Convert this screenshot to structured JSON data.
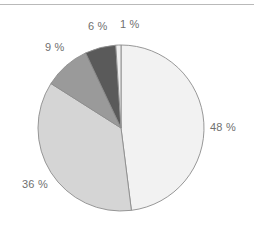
{
  "figure": {
    "background": "#ffffff",
    "rule_color": "#b9b9b9",
    "label_color": "#6f6f6f"
  },
  "chart_data": {
    "type": "pie",
    "title": "",
    "subtitle": "",
    "xlabel": "",
    "ylabel": "",
    "grid": false,
    "legend": "none",
    "start_angle_deg": 0,
    "direction": "clockwise",
    "center": {
      "x": 121,
      "y": 128
    },
    "radius": 83,
    "total": 100,
    "units": "%",
    "categories": [
      "48 %",
      "36 %",
      "9 %",
      "6 %",
      "1 %"
    ],
    "values": [
      48,
      36,
      9,
      6,
      1
    ],
    "colors": [
      "#f2f2f2",
      "#d5d5d5",
      "#9a9a9a",
      "#5a5a5a",
      "#ededed"
    ],
    "edge_color": "#8c8c8c",
    "slices": [
      {
        "label": "48 %",
        "value": 48,
        "color": "#f2f2f2",
        "start_deg": 0,
        "end_deg": 172.8,
        "label_x": 210,
        "label_y": 122
      },
      {
        "label": "36 %",
        "value": 36,
        "color": "#d5d5d5",
        "start_deg": 172.8,
        "end_deg": 302.4,
        "label_x": 22,
        "label_y": 179
      },
      {
        "label": "9 %",
        "value": 9,
        "color": "#9a9a9a",
        "start_deg": 302.4,
        "end_deg": 334.8,
        "label_x": 45,
        "label_y": 42
      },
      {
        "label": "6 %",
        "value": 6,
        "color": "#5a5a5a",
        "start_deg": 334.8,
        "end_deg": 356.4,
        "label_x": 88,
        "label_y": 21
      },
      {
        "label": "1 %",
        "value": 1,
        "color": "#ededed",
        "start_deg": 356.4,
        "end_deg": 360,
        "label_x": 120,
        "label_y": 19
      }
    ]
  }
}
